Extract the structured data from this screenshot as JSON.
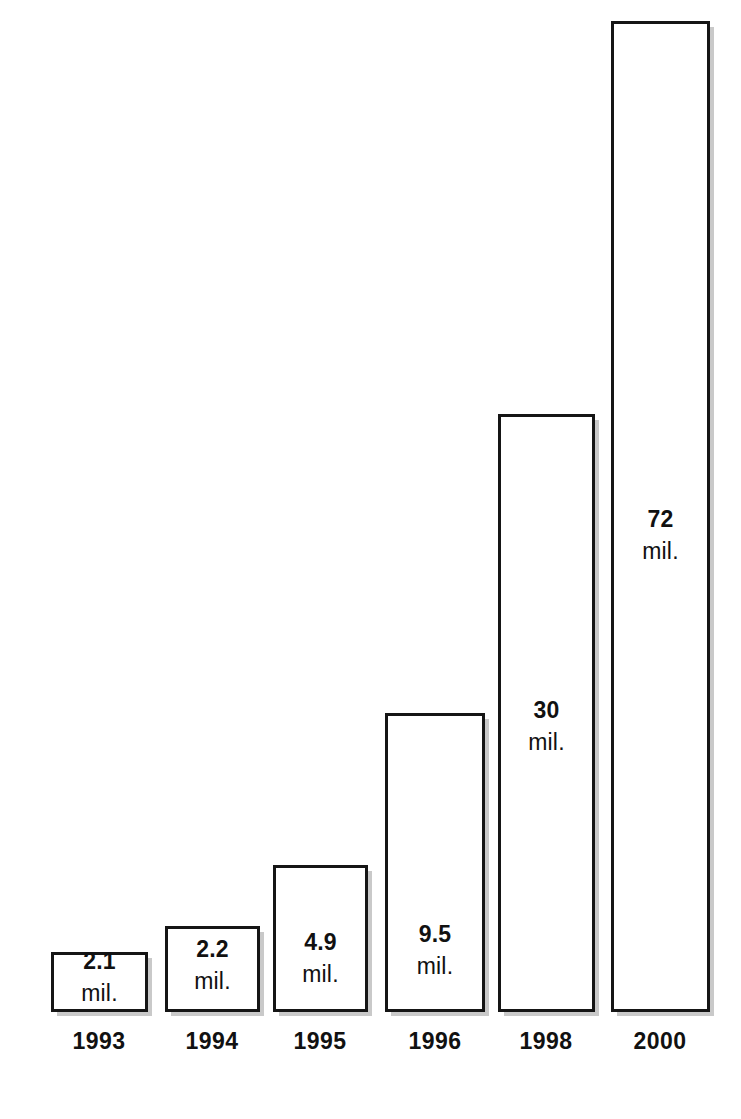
{
  "chart_data": {
    "type": "bar",
    "title": "",
    "subtitle": "",
    "xlabel": "",
    "ylabel": "",
    "unit_suffix": "mil.",
    "grid": false,
    "legend": false,
    "axis_lines": false,
    "ylim": [
      0,
      72
    ],
    "categories": [
      "1993",
      "1994",
      "1995",
      "1996",
      "1998",
      "2000"
    ],
    "values": [
      2.1,
      2.2,
      4.9,
      9.5,
      30,
      72
    ],
    "value_labels": [
      "2.1",
      "2.2",
      "4.9",
      "9.5",
      "30",
      "72"
    ],
    "unit_labels": [
      "mil.",
      "mil.",
      "mil.",
      "mil.",
      "mil.",
      "mil."
    ],
    "colors": {
      "background": "#ffffff",
      "bar_fill": "#ffffff",
      "bar_border": "#151515",
      "bar_shadow": "#787878",
      "text": "#111111"
    },
    "bars": [
      {
        "category": "1993",
        "value": 2.1,
        "value_label": "2.1",
        "unit_label": "mil.",
        "left": 51,
        "top": 952,
        "width": 97,
        "height": 60,
        "label_bottom_offset": 4
      },
      {
        "category": "1994",
        "value": 2.2,
        "value_label": "2.2",
        "unit_label": "mil.",
        "left": 165,
        "top": 926,
        "width": 95,
        "height": 86,
        "label_bottom_offset": 16
      },
      {
        "category": "1995",
        "value": 4.9,
        "value_label": "4.9",
        "unit_label": "mil.",
        "left": 273,
        "top": 865,
        "width": 95,
        "height": 147,
        "label_bottom_offset": 23
      },
      {
        "category": "1996",
        "value": 9.5,
        "value_label": "9.5",
        "unit_label": "mil.",
        "left": 385,
        "top": 713,
        "width": 100,
        "height": 299,
        "label_bottom_offset": 31
      },
      {
        "category": "1998",
        "value": 30,
        "value_label": "30",
        "unit_label": "mil.",
        "left": 498,
        "top": 414,
        "width": 97,
        "height": 598,
        "label_bottom_offset": 255
      },
      {
        "category": "2000",
        "value": 72,
        "value_label": "72",
        "unit_label": "mil.",
        "left": 611,
        "top": 21,
        "width": 99,
        "height": 991,
        "label_bottom_offset": 446
      }
    ],
    "tick_labels": [
      {
        "text": "1993",
        "center_x": 99,
        "top": 1028
      },
      {
        "text": "1994",
        "center_x": 212,
        "top": 1028
      },
      {
        "text": "1995",
        "center_x": 320,
        "top": 1028
      },
      {
        "text": "1996",
        "center_x": 435,
        "top": 1028
      },
      {
        "text": "1998",
        "center_x": 546,
        "top": 1028
      },
      {
        "text": "2000",
        "center_x": 660,
        "top": 1028
      }
    ],
    "baseline_y": 1012
  }
}
